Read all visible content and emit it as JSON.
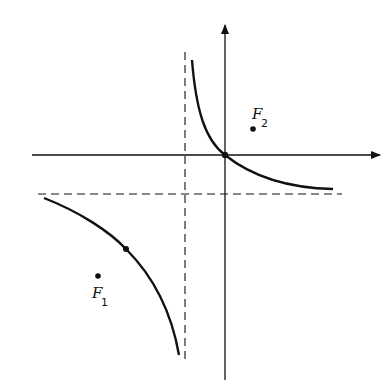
{
  "diagram": {
    "type": "hyperbola-with-asymptotes",
    "colors": {
      "stroke": "#111111",
      "background": "#ffffff"
    },
    "axes": {
      "x_axis": {
        "y": 155,
        "x_start": 32,
        "x_end": 380,
        "arrow": true
      },
      "y_axis": {
        "x": 225,
        "y_start": 380,
        "y_end": 25,
        "arrow": true
      }
    },
    "asymptotes": {
      "vertical": {
        "x": 185,
        "y_start": 52,
        "y_end": 360,
        "style": "dashed"
      },
      "horizontal": {
        "y": 194,
        "x_start": 38,
        "x_end": 342,
        "style": "dashed"
      }
    },
    "branches": [
      {
        "name": "upper-right",
        "path": "M192,60 C196,110 205,140 225,155 C250,175 285,188 333,189"
      },
      {
        "name": "lower-left",
        "path": "M44,198 C80,212 110,232 126,249 C155,278 172,315 179,355"
      }
    ],
    "points": [
      {
        "name": "origin-intersection",
        "x": 225,
        "y": 155
      },
      {
        "name": "branch-point",
        "x": 126,
        "y": 249
      }
    ],
    "foci": [
      {
        "label": "F",
        "subscript": "2",
        "dot_x": 253,
        "dot_y": 129,
        "label_x": 252,
        "label_y": 119,
        "sub_x": 261,
        "sub_y": 127
      },
      {
        "label": "F",
        "subscript": "1",
        "dot_x": 98,
        "dot_y": 276,
        "label_x": 92,
        "label_y": 298,
        "sub_x": 101,
        "sub_y": 306
      }
    ]
  }
}
